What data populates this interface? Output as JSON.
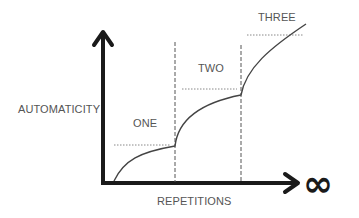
{
  "diagram": {
    "y_axis_label": "AUTOMATICITY",
    "x_axis_label": "REPETITIONS",
    "x_axis_end_symbol": "∞",
    "stages": [
      {
        "label": "ONE"
      },
      {
        "label": "TWO"
      },
      {
        "label": "THREE"
      }
    ],
    "colors": {
      "axis": "#1a1a1a",
      "curve": "#444444",
      "dashed_divider": "#555555",
      "dotted_level": "#888888",
      "text": "#555555",
      "background": "#ffffff"
    }
  }
}
